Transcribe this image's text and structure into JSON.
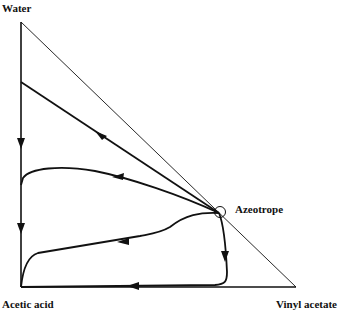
{
  "diagram": {
    "type": "ternary-residue-curve-map",
    "vertices": {
      "top": "Water",
      "bottom_left": "Acetic acid",
      "bottom_right": "Vinyl acetate"
    },
    "annotations": {
      "azeotrope": "Azeotrope"
    },
    "colors": {
      "line": "#111111",
      "background": "#ffffff"
    },
    "curves": [
      {
        "name": "curve-1",
        "from": "Azeotrope",
        "to": "Water-Acetic acid edge",
        "direction": "toward acetic acid"
      },
      {
        "name": "curve-2",
        "from": "Azeotrope",
        "to": "Water-Acetic acid edge",
        "direction": "toward acetic acid"
      },
      {
        "name": "curve-3",
        "from": "Azeotrope",
        "to": "Acetic acid",
        "direction": "toward acetic acid"
      },
      {
        "name": "curve-4",
        "from": "Azeotrope",
        "to": "Acetic acid",
        "via": "Acetic acid-Vinyl acetate edge",
        "direction": "toward acetic acid"
      },
      {
        "name": "left-edge",
        "from": "Water",
        "to": "Acetic acid",
        "direction": "downward"
      }
    ]
  }
}
